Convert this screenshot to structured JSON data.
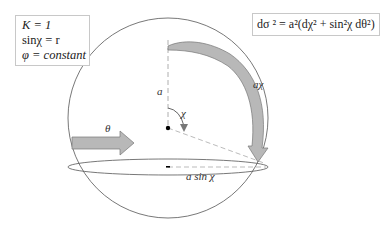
{
  "properties_box": {
    "line1": "K = 1",
    "line2": "sinχ = r",
    "line3": "φ = constant"
  },
  "metric_box": {
    "equation": "dσ ² = a²(dχ² + sin²χ dθ²)"
  },
  "labels": {
    "radius": "a",
    "angle": "χ",
    "arc_length": "aχ",
    "azimuth": "θ",
    "ring_radius": "a sin χ"
  },
  "colors": {
    "outline": "#555555",
    "arrow_fill": "#b8b8b8",
    "arrow_stroke": "#777777",
    "dashes": "#999999"
  }
}
